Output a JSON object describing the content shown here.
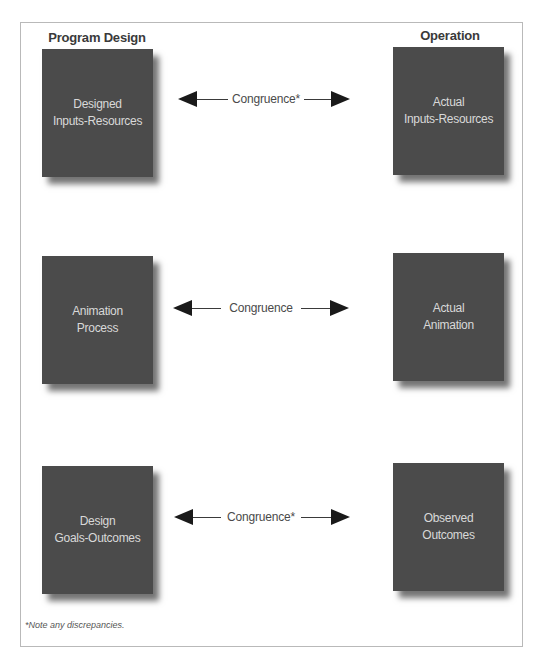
{
  "diagram": {
    "columns": {
      "left_header": "Program Design",
      "right_header": "Operation"
    },
    "rows": [
      {
        "left_box": "Designed\nInputs-Resources",
        "relation": "Congruence*",
        "right_box": "Actual\nInputs-Resources"
      },
      {
        "left_box": "Animation\nProcess",
        "relation": "Congruence",
        "right_box": "Actual\nAnimation"
      },
      {
        "left_box": "Design\nGoals-Outcomes",
        "relation": "Congruence*",
        "right_box": "Observed\nOutcomes"
      }
    ],
    "footnote": "*Note any discrepancies.",
    "colors": {
      "box_fill": "#4b4b4b",
      "box_text": "#d9d9d9",
      "arrow": "#1a1a1a",
      "frame_border": "#b9b9b9"
    }
  }
}
